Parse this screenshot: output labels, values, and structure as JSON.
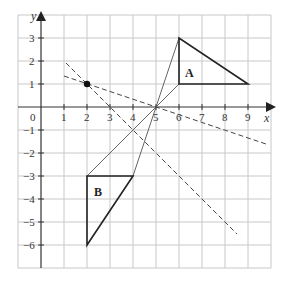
{
  "diagram": {
    "type": "coordinate-grid-transformation",
    "axes": {
      "x_label": "x",
      "y_label": "y",
      "origin_label": "0",
      "x_range": [
        -1,
        10
      ],
      "y_range": [
        -7,
        4
      ],
      "x_ticks": [
        "1",
        "2",
        "3",
        "4",
        "5",
        "6",
        "7",
        "8",
        "9"
      ],
      "y_ticks_positive": [
        "1",
        "2",
        "3"
      ],
      "y_ticks_negative": [
        "-1",
        "-2",
        "-3",
        "-4",
        "-5",
        "-6"
      ]
    },
    "shapes": [
      {
        "label": "A",
        "vertices": [
          [
            6,
            3
          ],
          [
            6,
            1
          ],
          [
            9,
            1
          ]
        ]
      },
      {
        "label": "B",
        "vertices": [
          [
            2,
            -3
          ],
          [
            4,
            -3
          ],
          [
            2,
            -6
          ]
        ]
      }
    ],
    "construction_lines": [
      {
        "style": "solid",
        "from": [
          6,
          3
        ],
        "to": [
          4,
          -3
        ]
      },
      {
        "style": "solid",
        "from": [
          6,
          1
        ],
        "to": [
          2,
          -3
        ]
      }
    ],
    "dashed_lines": [
      {
        "style": "dashed",
        "from": [
          1,
          1.33
        ],
        "to": [
          9.8,
          -1.6
        ]
      },
      {
        "style": "dashed",
        "from": [
          1.1,
          1.9
        ],
        "to": [
          8.5,
          -5.5
        ]
      }
    ],
    "points": [
      {
        "name": "marked-point",
        "coords": [
          2,
          1
        ]
      }
    ],
    "colors": {
      "grid": "#c8c8c8",
      "axis": "#333333",
      "shape": "#222222",
      "line": "#555555"
    }
  }
}
